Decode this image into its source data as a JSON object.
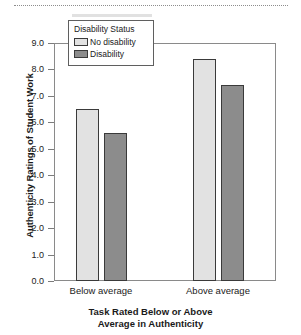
{
  "chart_data": {
    "type": "bar",
    "title": "",
    "xlabel_lines": [
      "Task Rated Below or Above",
      "Average in Authenticity"
    ],
    "xlabel": "Task Rated Below or Above Average in Authenticity",
    "ylabel": "Authenticity Ratings of Student Work",
    "categories": [
      "Below average",
      "Above average"
    ],
    "series": [
      {
        "name": "No disability",
        "values": [
          6.5,
          8.4
        ],
        "color": "#e2e2e2"
      },
      {
        "name": "Disability",
        "values": [
          5.6,
          7.4
        ],
        "color": "#8c8c8c"
      }
    ],
    "ylim": [
      0.0,
      9.0
    ],
    "ytick_labels": [
      "9.0",
      "8.0",
      "7.0",
      "6.0",
      "5.0",
      "4.0",
      "3.0",
      "2.0",
      "1.0",
      "0.0"
    ],
    "ytick_values": [
      9.0,
      8.0,
      7.0,
      6.0,
      5.0,
      4.0,
      3.0,
      2.0,
      1.0,
      0.0
    ],
    "grid": false,
    "legend": {
      "title": "Disability Status",
      "position": "top-left-inside",
      "entries": [
        "No disability",
        "Disability"
      ]
    }
  }
}
